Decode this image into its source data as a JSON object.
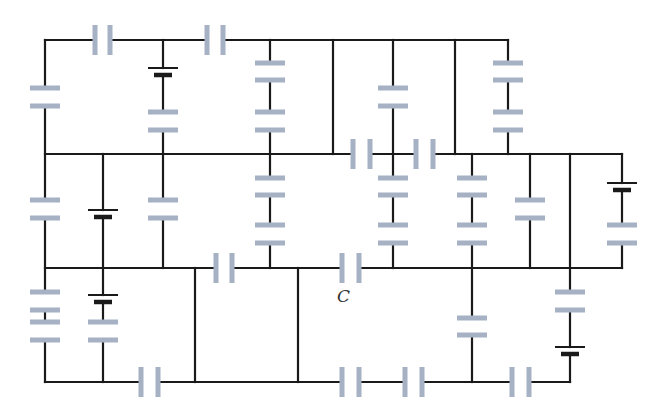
{
  "diagram": {
    "type": "circuit-schematic",
    "colors": {
      "wire": "#1a1a1a",
      "capacitor": "#a6b2c4",
      "battery": "#1a1a1a",
      "background": "#ffffff"
    },
    "labels": [
      {
        "id": "C",
        "text": "C",
        "x": 337,
        "y": 302
      }
    ],
    "wires": [
      [
        45,
        40,
        93,
        40
      ],
      [
        110,
        40,
        207,
        40
      ],
      [
        225,
        40,
        508,
        40
      ],
      [
        45,
        154,
        352,
        154
      ],
      [
        372,
        154,
        415,
        154
      ],
      [
        435,
        154,
        622,
        154
      ],
      [
        45,
        268,
        215,
        268
      ],
      [
        233,
        268,
        340,
        268
      ],
      [
        360,
        268,
        622,
        268
      ],
      [
        45,
        382,
        140,
        382
      ],
      [
        160,
        382,
        340,
        382
      ],
      [
        360,
        382,
        405,
        382
      ],
      [
        425,
        382,
        512,
        382
      ],
      [
        530,
        382,
        570,
        382
      ],
      [
        45,
        40,
        45,
        88
      ],
      [
        45,
        106,
        45,
        200
      ],
      [
        45,
        218,
        45,
        292
      ],
      [
        45,
        310,
        45,
        322
      ],
      [
        45,
        340,
        45,
        382
      ],
      [
        103,
        154,
        103,
        210
      ],
      [
        103,
        217,
        103,
        295
      ],
      [
        103,
        302,
        103,
        322
      ],
      [
        103,
        340,
        103,
        382
      ],
      [
        163,
        40,
        163,
        68
      ],
      [
        163,
        75,
        163,
        112
      ],
      [
        163,
        130,
        163,
        200
      ],
      [
        163,
        218,
        163,
        268
      ],
      [
        270,
        40,
        270,
        63
      ],
      [
        270,
        80,
        270,
        112
      ],
      [
        270,
        130,
        270,
        178
      ],
      [
        270,
        195,
        270,
        225
      ],
      [
        270,
        243,
        270,
        268
      ],
      [
        333,
        40,
        333,
        154
      ],
      [
        393,
        40,
        393,
        88
      ],
      [
        393,
        106,
        393,
        178
      ],
      [
        393,
        195,
        393,
        225
      ],
      [
        393,
        243,
        393,
        268
      ],
      [
        455,
        40,
        455,
        154
      ],
      [
        508,
        40,
        508,
        63
      ],
      [
        508,
        80,
        508,
        112
      ],
      [
        508,
        130,
        508,
        154
      ],
      [
        472,
        154,
        472,
        178
      ],
      [
        472,
        195,
        472,
        225
      ],
      [
        472,
        243,
        472,
        318
      ],
      [
        472,
        335,
        472,
        382
      ],
      [
        530,
        154,
        530,
        200
      ],
      [
        530,
        218,
        530,
        268
      ],
      [
        570,
        154,
        570,
        292
      ],
      [
        570,
        310,
        570,
        347
      ],
      [
        570,
        354,
        570,
        382
      ],
      [
        622,
        154,
        622,
        183
      ],
      [
        622,
        190,
        622,
        225
      ],
      [
        622,
        243,
        622,
        268
      ],
      [
        195,
        268,
        195,
        382
      ],
      [
        298,
        268,
        298,
        382
      ]
    ],
    "capacitors_horizontal_plates": [
      {
        "x": 45,
        "y1": 88,
        "y2": 106
      },
      {
        "x": 45,
        "y1": 200,
        "y2": 218
      },
      {
        "x": 45,
        "y1": 292,
        "y2": 310
      },
      {
        "x": 45,
        "y1": 322,
        "y2": 340
      },
      {
        "x": 103,
        "y1": 322,
        "y2": 340
      },
      {
        "x": 163,
        "y1": 112,
        "y2": 130
      },
      {
        "x": 163,
        "y1": 200,
        "y2": 218
      },
      {
        "x": 270,
        "y1": 63,
        "y2": 80
      },
      {
        "x": 270,
        "y1": 112,
        "y2": 130
      },
      {
        "x": 270,
        "y1": 178,
        "y2": 195
      },
      {
        "x": 270,
        "y1": 225,
        "y2": 243
      },
      {
        "x": 393,
        "y1": 88,
        "y2": 106
      },
      {
        "x": 393,
        "y1": 178,
        "y2": 195
      },
      {
        "x": 393,
        "y1": 225,
        "y2": 243
      },
      {
        "x": 508,
        "y1": 63,
        "y2": 80
      },
      {
        "x": 508,
        "y1": 112,
        "y2": 130
      },
      {
        "x": 472,
        "y1": 178,
        "y2": 195
      },
      {
        "x": 472,
        "y1": 225,
        "y2": 243
      },
      {
        "x": 472,
        "y1": 318,
        "y2": 335
      },
      {
        "x": 530,
        "y1": 200,
        "y2": 218
      },
      {
        "x": 570,
        "y1": 292,
        "y2": 310
      },
      {
        "x": 622,
        "y1": 225,
        "y2": 243
      }
    ],
    "capacitors_vertical_plates": [
      {
        "y": 40,
        "x1": 95,
        "x2": 110
      },
      {
        "y": 40,
        "x1": 207,
        "x2": 223
      },
      {
        "y": 154,
        "x1": 353,
        "x2": 370
      },
      {
        "y": 154,
        "x1": 416,
        "x2": 433
      },
      {
        "y": 268,
        "x1": 216,
        "x2": 232
      },
      {
        "y": 268,
        "x1": 342,
        "x2": 359
      },
      {
        "y": 382,
        "x1": 141,
        "x2": 158
      },
      {
        "y": 382,
        "x1": 342,
        "x2": 359
      },
      {
        "y": 382,
        "x1": 405,
        "x2": 422
      },
      {
        "y": 382,
        "x1": 512,
        "x2": 529
      }
    ],
    "batteries": [
      {
        "x": 163,
        "y_long": 68,
        "y_short": 75
      },
      {
        "x": 103,
        "y_long": 210,
        "y_short": 217
      },
      {
        "x": 103,
        "y_long": 295,
        "y_short": 302
      },
      {
        "x": 622,
        "y_long": 183,
        "y_short": 190
      },
      {
        "x": 570,
        "y_long": 347,
        "y_short": 354
      }
    ]
  }
}
